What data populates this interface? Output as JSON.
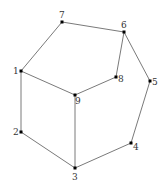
{
  "diagram": {
    "type": "graph",
    "nodes": [
      {
        "id": "1",
        "label": "1",
        "x": 21,
        "y": 71,
        "lx": 13,
        "ly": 74
      },
      {
        "id": "2",
        "label": "2",
        "x": 21,
        "y": 132,
        "lx": 13,
        "ly": 135
      },
      {
        "id": "3",
        "label": "3",
        "x": 75,
        "y": 168,
        "lx": 72,
        "ly": 180
      },
      {
        "id": "4",
        "label": "4",
        "x": 131,
        "y": 143,
        "lx": 133,
        "ly": 150
      },
      {
        "id": "5",
        "label": "5",
        "x": 150,
        "y": 81,
        "lx": 152,
        "ly": 85
      },
      {
        "id": "6",
        "label": "6",
        "x": 124,
        "y": 32,
        "lx": 121,
        "ly": 28
      },
      {
        "id": "7",
        "label": "7",
        "x": 62,
        "y": 22,
        "lx": 59,
        "ly": 18
      },
      {
        "id": "8",
        "label": "8",
        "x": 116,
        "y": 77,
        "lx": 118,
        "ly": 82
      },
      {
        "id": "9",
        "label": "9",
        "x": 75,
        "y": 95,
        "lx": 75,
        "ly": 104
      }
    ],
    "edges": [
      [
        "7",
        "1"
      ],
      [
        "7",
        "6"
      ],
      [
        "6",
        "8"
      ],
      [
        "6",
        "5"
      ],
      [
        "1",
        "9"
      ],
      [
        "1",
        "2"
      ],
      [
        "8",
        "9"
      ],
      [
        "9",
        "3"
      ],
      [
        "2",
        "3"
      ],
      [
        "3",
        "4"
      ],
      [
        "4",
        "5"
      ]
    ],
    "colors": {
      "edge": "#7a7a7a",
      "node": "#000000",
      "label": "#333333"
    }
  }
}
